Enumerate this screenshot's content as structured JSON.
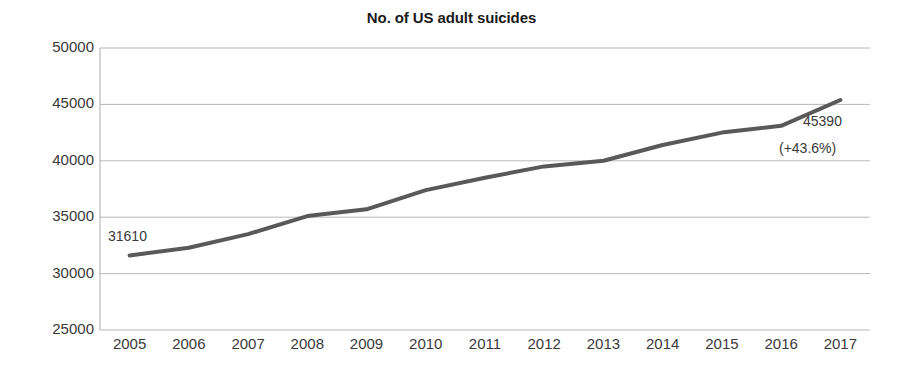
{
  "chart_data": {
    "type": "line",
    "title": "No. of US adult suicides",
    "xlabel": "",
    "ylabel": "",
    "categories": [
      "2005",
      "2006",
      "2007",
      "2008",
      "2009",
      "2010",
      "2011",
      "2012",
      "2013",
      "2014",
      "2015",
      "2016",
      "2017"
    ],
    "values": [
      31610,
      32300,
      33500,
      35100,
      35700,
      37400,
      38500,
      39500,
      40000,
      41400,
      42500,
      43100,
      45390
    ],
    "ylim": [
      25000,
      50000
    ],
    "ytick_labels": [
      "50000",
      "45000",
      "40000",
      "35000",
      "30000",
      "25000"
    ],
    "yticks": [
      50000,
      45000,
      40000,
      35000,
      30000,
      25000
    ],
    "grid": true,
    "legend": "none",
    "series_color": "#595959",
    "annotations": [
      {
        "name": "first-point-value",
        "text": "31610",
        "at_category": "2005"
      },
      {
        "name": "last-point-value",
        "text": "45390",
        "at_category": "2017"
      },
      {
        "name": "last-point-percent-change",
        "text": "(+43.6%)",
        "at_category": "2017"
      }
    ]
  }
}
